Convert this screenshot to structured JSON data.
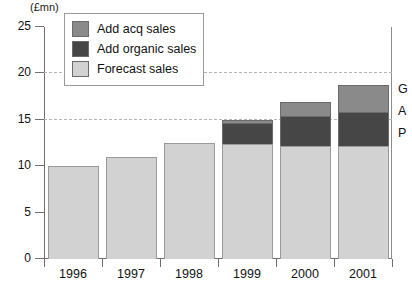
{
  "chart_data": {
    "type": "bar",
    "title": "",
    "subtitle": "",
    "units_label": "(£mn)",
    "xlabel": "",
    "ylabel": "",
    "ylim": [
      0,
      25
    ],
    "yticks": [
      0,
      5,
      10,
      15,
      20,
      25
    ],
    "ytick_labels": [
      "0",
      "5",
      "10",
      "15",
      "20",
      "25"
    ],
    "gridlines": [
      15,
      20
    ],
    "grid": true,
    "stacked": true,
    "legend_position": "top-left-inside",
    "categories": [
      "1996",
      "1997",
      "1998",
      "1999",
      "2000",
      "2001"
    ],
    "series": [
      {
        "name": "Forecast sales",
        "color": "#d2d2d2",
        "values": [
          10.0,
          11.0,
          12.5,
          12.4,
          12.2,
          12.2
        ]
      },
      {
        "name": "Add organic sales",
        "color": "#464646",
        "values": [
          0,
          0,
          0,
          2.3,
          3.2,
          3.6
        ]
      },
      {
        "name": "Add acq sales",
        "color": "#8a8a8a",
        "values": [
          0,
          0,
          0,
          0.3,
          1.5,
          3.0
        ]
      }
    ],
    "totals": [
      10.0,
      11.0,
      12.5,
      15.0,
      16.9,
      18.8
    ],
    "annotations": [
      {
        "text": "G",
        "position": "right-edge"
      },
      {
        "text": "A",
        "position": "right-edge"
      },
      {
        "text": "P",
        "position": "right-edge"
      }
    ]
  },
  "legend": {
    "items": [
      {
        "label": "Add acq sales",
        "color": "#8a8a8a"
      },
      {
        "label": "Add organic sales",
        "color": "#464646"
      },
      {
        "label": "Forecast sales",
        "color": "#d2d2d2"
      }
    ]
  }
}
